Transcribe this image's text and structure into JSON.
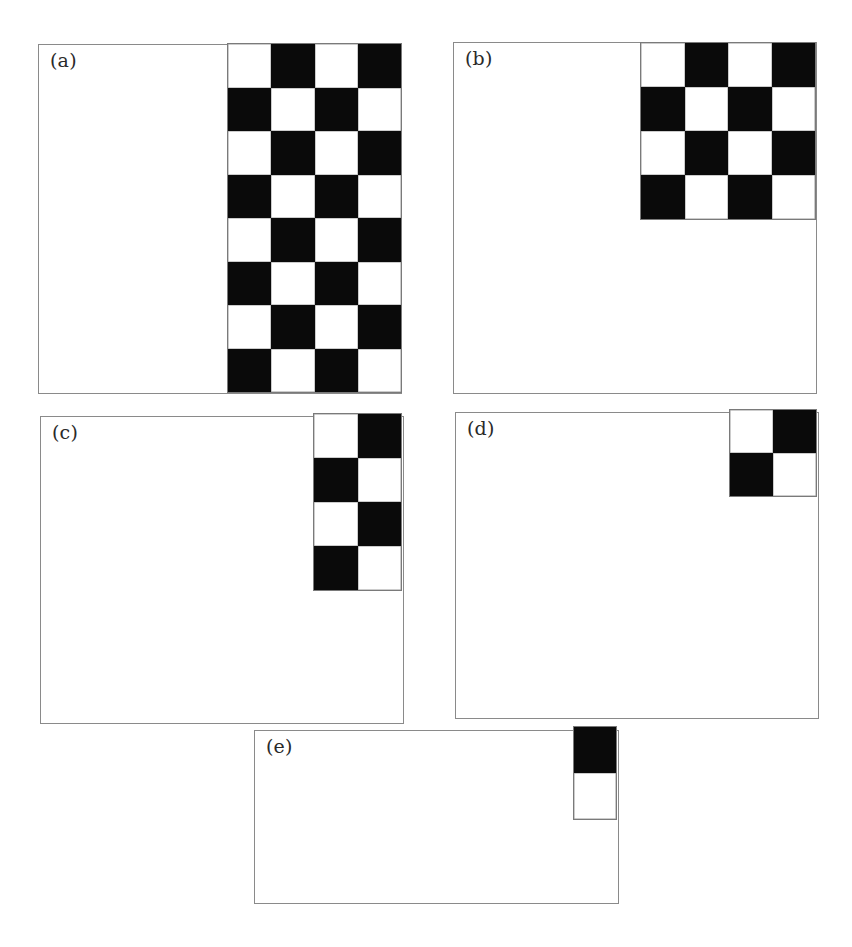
{
  "figure": {
    "panels": [
      {
        "id": "a",
        "label": "(a)",
        "box": {
          "left": 38,
          "top": 44,
          "width": 364,
          "height": 350
        },
        "grid": {
          "left": 227,
          "top": 43,
          "width": 175,
          "height": 350,
          "cols": 4,
          "rows": 8,
          "first_cell": "white"
        }
      },
      {
        "id": "b",
        "label": "(b)",
        "box": {
          "left": 453,
          "top": 42,
          "width": 364,
          "height": 352
        },
        "grid": {
          "left": 640,
          "top": 42,
          "width": 176,
          "height": 178,
          "cols": 4,
          "rows": 4,
          "first_cell": "white"
        }
      },
      {
        "id": "c",
        "label": "(c)",
        "box": {
          "left": 40,
          "top": 416,
          "width": 364,
          "height": 308
        },
        "grid": {
          "left": 313,
          "top": 413,
          "width": 89,
          "height": 178,
          "cols": 2,
          "rows": 4,
          "first_cell": "white"
        }
      },
      {
        "id": "d",
        "label": "(d)",
        "box": {
          "left": 455,
          "top": 412,
          "width": 364,
          "height": 307
        },
        "grid": {
          "left": 729,
          "top": 409,
          "width": 88,
          "height": 88,
          "cols": 2,
          "rows": 2,
          "first_cell": "white"
        }
      },
      {
        "id": "e",
        "label": "(e)",
        "box": {
          "left": 254,
          "top": 730,
          "width": 365,
          "height": 174
        },
        "grid": {
          "left": 573,
          "top": 726,
          "width": 44,
          "height": 94,
          "cols": 1,
          "rows": 2,
          "first_cell": "black"
        }
      }
    ],
    "colors": {
      "black_cell": "#0a0a0a",
      "white_cell": "#ffffff",
      "border": "#8a8a8a"
    }
  }
}
